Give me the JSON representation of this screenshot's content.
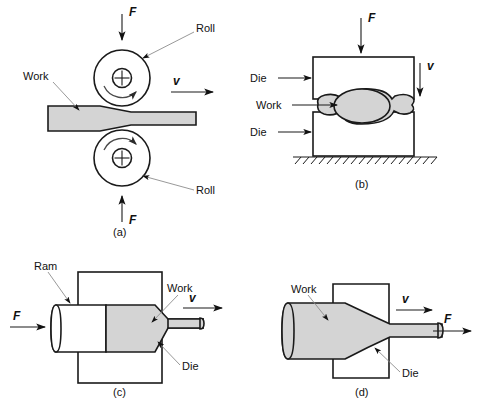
{
  "figure": {
    "colors": {
      "work_fill": "#d4d4d4",
      "part_fill": "#ffffff",
      "line": "#1a1a1a",
      "leader": "#8d8d8d",
      "background": "#ffffff"
    },
    "panels": [
      {
        "id": "a",
        "caption": "(a)",
        "process": "rolling",
        "labels": [
          {
            "name": "force-top",
            "text": "F",
            "style": "italic"
          },
          {
            "name": "force-bottom",
            "text": "F",
            "style": "italic"
          },
          {
            "name": "velocity",
            "text": "v",
            "style": "italic"
          },
          {
            "name": "roll-top",
            "text": "Roll",
            "style": "plain"
          },
          {
            "name": "roll-bottom",
            "text": "Roll",
            "style": "plain"
          },
          {
            "name": "work",
            "text": "Work",
            "style": "plain"
          }
        ]
      },
      {
        "id": "b",
        "caption": "(b)",
        "process": "forging",
        "labels": [
          {
            "name": "force-top",
            "text": "F",
            "style": "italic"
          },
          {
            "name": "velocity",
            "text": "v",
            "style": "italic"
          },
          {
            "name": "die-upper",
            "text": "Die",
            "style": "plain"
          },
          {
            "name": "die-lower",
            "text": "Die",
            "style": "plain"
          },
          {
            "name": "work",
            "text": "Work",
            "style": "plain"
          }
        ]
      },
      {
        "id": "c",
        "caption": "(c)",
        "process": "extrusion",
        "labels": [
          {
            "name": "force",
            "text": "F",
            "style": "italic"
          },
          {
            "name": "velocity",
            "text": "v",
            "style": "italic"
          },
          {
            "name": "ram",
            "text": "Ram",
            "style": "plain"
          },
          {
            "name": "work",
            "text": "Work",
            "style": "plain"
          },
          {
            "name": "die",
            "text": "Die",
            "style": "plain"
          }
        ]
      },
      {
        "id": "d",
        "caption": "(d)",
        "process": "drawing",
        "labels": [
          {
            "name": "force",
            "text": "F",
            "style": "italic"
          },
          {
            "name": "velocity",
            "text": "v",
            "style": "italic"
          },
          {
            "name": "work",
            "text": "Work",
            "style": "plain"
          },
          {
            "name": "die",
            "text": "Die",
            "style": "plain"
          }
        ]
      }
    ]
  }
}
